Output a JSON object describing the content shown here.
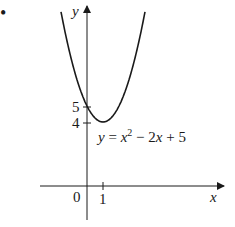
{
  "bullet": "•",
  "axes": {
    "x_label": "x",
    "y_label": "y",
    "origin_label": "0",
    "x_tick_label": "1",
    "y_tick_labels": [
      "5",
      "4"
    ]
  },
  "curve": {
    "equation_label": "y = x² − 2x + 5",
    "equation_parts": {
      "lhs": "y",
      "eq": " = ",
      "x1": "x",
      "sup": "2",
      "rest1": " − 2",
      "x2": "x",
      "rest2": " + 5"
    },
    "vertex": [
      1,
      4
    ],
    "y_intercept": 5
  },
  "colors": {
    "ink": "#1a1a1a",
    "background": "#ffffff"
  }
}
